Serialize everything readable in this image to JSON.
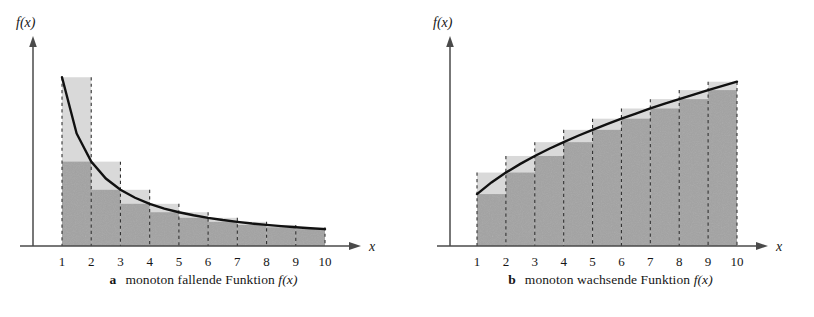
{
  "figure": {
    "background": "#ffffff",
    "panels": [
      {
        "key": "a",
        "label": "a",
        "caption_text": "monoton fallende Funktion",
        "caption_fx": "f(x)",
        "y_axis_label": "f(x)",
        "x_axis_label": "x"
      },
      {
        "key": "b",
        "label": "b",
        "caption_text": "monoton wachsende Funktion",
        "caption_fx": "f(x)",
        "y_axis_label": "f(x)",
        "x_axis_label": "x"
      }
    ]
  },
  "colors": {
    "upper_sum_fill": "#d9d9d9",
    "lower_sum_fill": "#a3a3a3",
    "curve": "#111111",
    "axis": "#4a4a4a",
    "gridline": "#333333",
    "text": "#161616"
  },
  "chart_data": [
    {
      "type": "bar",
      "title": "a  monoton fallende Funktion f(x)",
      "xlabel": "x",
      "ylabel": "f(x)",
      "grid": true,
      "legend": "none",
      "xlim": [
        0,
        10.8
      ],
      "ylim": [
        0,
        1.12
      ],
      "xticks": [
        1,
        2,
        3,
        4,
        5,
        6,
        7,
        8,
        9,
        10
      ],
      "xtick_labels": [
        "1",
        "2",
        "3",
        "4",
        "5",
        "6",
        "7",
        "8",
        "9",
        "10"
      ],
      "curve": {
        "name": "monoton fallende Funktion f(x)",
        "formula": "1/x",
        "x": [
          1,
          1.5,
          2,
          2.5,
          3,
          3.5,
          4,
          4.5,
          5,
          5.5,
          6,
          6.5,
          7,
          7.5,
          8,
          8.5,
          9,
          9.5,
          10
        ],
        "y": [
          1.0,
          0.667,
          0.5,
          0.4,
          0.333,
          0.286,
          0.25,
          0.222,
          0.2,
          0.182,
          0.167,
          0.154,
          0.143,
          0.133,
          0.125,
          0.118,
          0.111,
          0.105,
          0.1
        ]
      },
      "series": [
        {
          "name": "Obersumme (upper sum, left endpoints)",
          "fill": "#d9d9d9",
          "categories": [
            "1-2",
            "2-3",
            "3-4",
            "4-5",
            "5-6",
            "6-7",
            "7-8",
            "8-9",
            "9-10"
          ],
          "values": [
            1.0,
            0.5,
            0.333,
            0.25,
            0.2,
            0.167,
            0.143,
            0.125,
            0.111
          ]
        },
        {
          "name": "Untersumme (lower sum, right endpoints)",
          "fill": "#a3a3a3",
          "categories": [
            "1-2",
            "2-3",
            "3-4",
            "4-5",
            "5-6",
            "6-7",
            "7-8",
            "8-9",
            "9-10"
          ],
          "values": [
            0.5,
            0.333,
            0.25,
            0.2,
            0.167,
            0.143,
            0.125,
            0.111,
            0.1
          ]
        }
      ]
    },
    {
      "type": "bar",
      "title": "b  monoton wachsende Funktion f(x)",
      "xlabel": "x",
      "ylabel": "f(x)",
      "grid": true,
      "legend": "none",
      "xlim": [
        0,
        10.8
      ],
      "ylim": [
        0,
        1.12
      ],
      "xticks": [
        1,
        2,
        3,
        4,
        5,
        6,
        7,
        8,
        9,
        10
      ],
      "xtick_labels": [
        "1",
        "2",
        "3",
        "4",
        "5",
        "6",
        "7",
        "8",
        "9",
        "10"
      ],
      "curve": {
        "name": "monoton wachsende Funktion f(x)",
        "formula": "sqrt(x)/sqrt(10)",
        "x": [
          1,
          1.5,
          2,
          2.5,
          3,
          3.5,
          4,
          4.5,
          5,
          5.5,
          6,
          6.5,
          7,
          7.5,
          8,
          8.5,
          9,
          9.5,
          10
        ],
        "y": [
          0.316,
          0.387,
          0.447,
          0.5,
          0.548,
          0.592,
          0.632,
          0.671,
          0.707,
          0.742,
          0.775,
          0.806,
          0.837,
          0.866,
          0.894,
          0.922,
          0.949,
          0.975,
          1.0
        ]
      },
      "series": [
        {
          "name": "Untersumme (lower sum, left endpoints)",
          "fill": "#a3a3a3",
          "categories": [
            "1-2",
            "2-3",
            "3-4",
            "4-5",
            "5-6",
            "6-7",
            "7-8",
            "8-9",
            "9-10"
          ],
          "values": [
            0.316,
            0.447,
            0.548,
            0.632,
            0.707,
            0.775,
            0.837,
            0.894,
            0.949
          ]
        },
        {
          "name": "Obersumme (upper sum, right endpoints)",
          "fill": "#d9d9d9",
          "categories": [
            "1-2",
            "2-3",
            "3-4",
            "4-5",
            "5-6",
            "6-7",
            "7-8",
            "8-9",
            "9-10"
          ],
          "values": [
            0.447,
            0.548,
            0.632,
            0.707,
            0.775,
            0.837,
            0.894,
            0.949,
            1.0
          ]
        }
      ]
    }
  ]
}
